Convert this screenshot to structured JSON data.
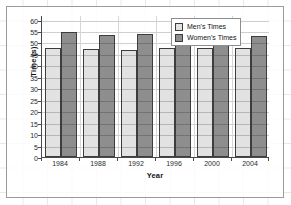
{
  "chart_data": {
    "type": "bar",
    "title": "",
    "xlabel": "Year",
    "ylabel": "Time (s)",
    "categories": [
      "1984",
      "1988",
      "1992",
      "1996",
      "2000",
      "2004"
    ],
    "series": [
      {
        "name": "Men's Times",
        "color": "#e2e2e2",
        "values": [
          47.8,
          47.3,
          46.7,
          47.7,
          47.6,
          47.8
        ]
      },
      {
        "name": "Women's Times",
        "color": "#8e8e8e",
        "values": [
          54.6,
          53.4,
          53.5,
          52.7,
          53.0,
          52.8
        ]
      }
    ],
    "ylim": [
      0,
      62
    ],
    "yticks": [
      0,
      5,
      10,
      15,
      20,
      25,
      30,
      35,
      40,
      45,
      50,
      55,
      60
    ],
    "ytick_labels": [
      "0",
      "5",
      "10",
      "15",
      "20",
      "25",
      "30",
      "35",
      "40",
      "45",
      "50",
      "55",
      "60"
    ],
    "grid": true,
    "legend_position": "top-right"
  },
  "axes": {
    "y_title": "Time (s)",
    "x_title": "Year"
  },
  "legend": {
    "entries": [
      {
        "label": "Men's Times"
      },
      {
        "label": "Women's Times"
      }
    ]
  }
}
